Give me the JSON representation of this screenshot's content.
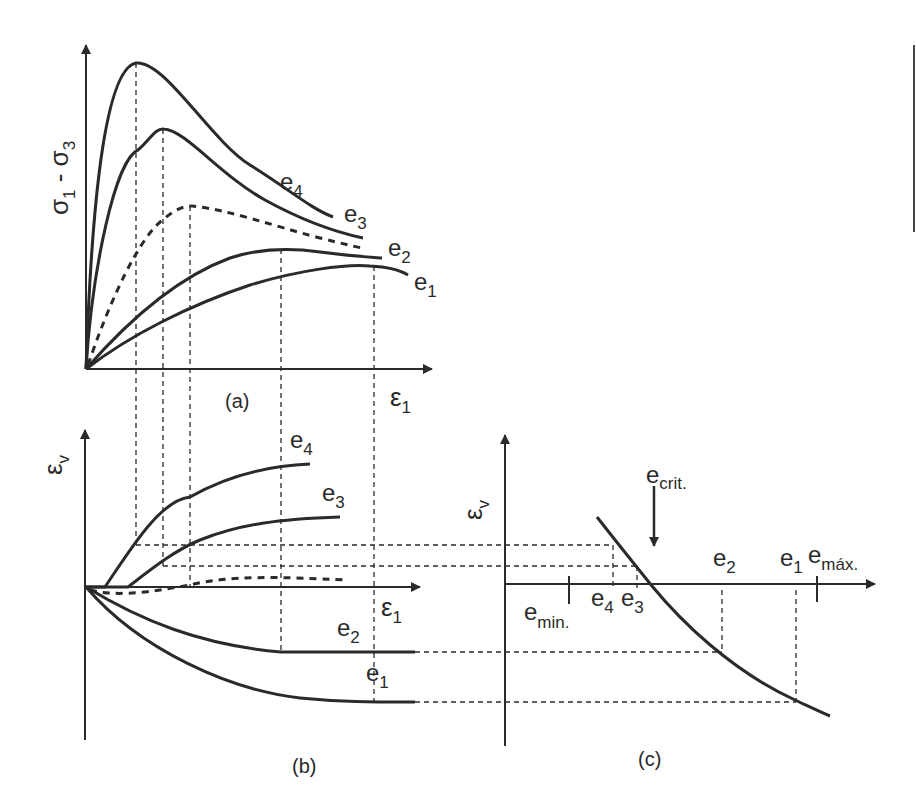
{
  "figure": {
    "line_color": "#2a2a2a",
    "background": "#ffffff",
    "panel_a": {
      "caption": "(a)",
      "y_label": {
        "base": "σ",
        "sub1": "1",
        "mid": " - σ",
        "sub2": "3"
      },
      "x_label": {
        "base": "ε",
        "sub": "1"
      },
      "curves": [
        {
          "name": "e",
          "sub": "4",
          "style": "solid"
        },
        {
          "name": "e",
          "sub": "3",
          "style": "solid"
        },
        {
          "name": "critical",
          "style": "dashed"
        },
        {
          "name": "e",
          "sub": "2",
          "style": "solid"
        },
        {
          "name": "e",
          "sub": "1",
          "style": "solid"
        }
      ]
    },
    "panel_b": {
      "caption": "(b)",
      "y_label": {
        "base": "ε",
        "sub": "v"
      },
      "x_label": {
        "base": "ε",
        "sub": "1"
      },
      "curves": [
        {
          "name": "e",
          "sub": "4"
        },
        {
          "name": "e",
          "sub": "3"
        },
        {
          "name": "e",
          "sub": "2"
        },
        {
          "name": "e",
          "sub": "1"
        }
      ]
    },
    "panel_c": {
      "caption": "(c)",
      "y_label": {
        "base": "ε",
        "sub": "v"
      },
      "arrow_label": {
        "base": "e",
        "sub": "crit."
      },
      "x_ticks": [
        {
          "base": "e",
          "sub": "min."
        },
        {
          "base": "e",
          "sub": "4"
        },
        {
          "base": "e",
          "sub": "3"
        },
        {
          "base": "e",
          "sub": "2"
        },
        {
          "base": "e",
          "sub": "1"
        },
        {
          "base": "e",
          "sub": "máx."
        }
      ]
    }
  }
}
